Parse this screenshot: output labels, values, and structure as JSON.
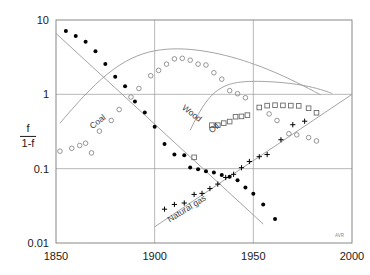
{
  "chart_data": {
    "type": "scatter",
    "title": "",
    "xlabel": "",
    "ylabel": "f / 1-f",
    "ylabel_numerator": "f",
    "ylabel_denominator": "1-f",
    "xlim": [
      1850,
      2000
    ],
    "ylim": [
      0.01,
      10
    ],
    "yscale": "log",
    "xticks": [
      1850,
      1900,
      1950,
      2000
    ],
    "xtick_labels": [
      "1850",
      "1900",
      "1950",
      "2000"
    ],
    "yticks": [
      0.01,
      0.1,
      1,
      10
    ],
    "ytick_labels": [
      "0.01",
      "0.1",
      "1",
      "10"
    ],
    "grid": true,
    "legend": "inline-annotations",
    "credit": "AVR",
    "series": [
      {
        "name": "Wood",
        "marker": "filled-circle",
        "color": "#000000",
        "label_x": 1918,
        "label_y": 0.52,
        "label_rotation": 38,
        "fit_line": {
          "x": [
            1850,
            1955
          ],
          "y": [
            6.6,
            0.018
          ]
        },
        "points": [
          {
            "x": 1855,
            "y": 7.1
          },
          {
            "x": 1860,
            "y": 6.1
          },
          {
            "x": 1865,
            "y": 5.1
          },
          {
            "x": 1870,
            "y": 3.8
          },
          {
            "x": 1875,
            "y": 2.55
          },
          {
            "x": 1880,
            "y": 1.72
          },
          {
            "x": 1885,
            "y": 1.28
          },
          {
            "x": 1890,
            "y": 0.8
          },
          {
            "x": 1895,
            "y": 0.57
          },
          {
            "x": 1900,
            "y": 0.365
          },
          {
            "x": 1905,
            "y": 0.215
          },
          {
            "x": 1910,
            "y": 0.155
          },
          {
            "x": 1915,
            "y": 0.152
          },
          {
            "x": 1918,
            "y": 0.104
          },
          {
            "x": 1922,
            "y": 0.098
          },
          {
            "x": 1926,
            "y": 0.092
          },
          {
            "x": 1930,
            "y": 0.089
          },
          {
            "x": 1934,
            "y": 0.082
          },
          {
            "x": 1938,
            "y": 0.078
          },
          {
            "x": 1942,
            "y": 0.07
          },
          {
            "x": 1946,
            "y": 0.056
          },
          {
            "x": 1950,
            "y": 0.046
          },
          {
            "x": 1955,
            "y": 0.033
          },
          {
            "x": 1961,
            "y": 0.021
          }
        ]
      },
      {
        "name": "Coal",
        "marker": "open-circle",
        "color": "#8a8a8a",
        "label_x": 1872,
        "label_y": 0.4,
        "label_rotation": -38,
        "fit_curve_peak": {
          "x": 1912,
          "y": 3.05
        },
        "points": [
          {
            "x": 1852,
            "y": 0.172
          },
          {
            "x": 1858,
            "y": 0.188
          },
          {
            "x": 1862,
            "y": 0.205
          },
          {
            "x": 1865,
            "y": 0.22
          },
          {
            "x": 1868,
            "y": 0.163
          },
          {
            "x": 1872,
            "y": 0.32
          },
          {
            "x": 1878,
            "y": 0.445
          },
          {
            "x": 1882,
            "y": 0.625
          },
          {
            "x": 1888,
            "y": 0.92
          },
          {
            "x": 1892,
            "y": 1.2
          },
          {
            "x": 1898,
            "y": 1.78
          },
          {
            "x": 1902,
            "y": 2.1
          },
          {
            "x": 1906,
            "y": 2.55
          },
          {
            "x": 1910,
            "y": 3.0
          },
          {
            "x": 1914,
            "y": 3.05
          },
          {
            "x": 1918,
            "y": 2.88
          },
          {
            "x": 1922,
            "y": 2.55
          },
          {
            "x": 1926,
            "y": 2.48
          },
          {
            "x": 1930,
            "y": 1.95
          },
          {
            "x": 1934,
            "y": 1.6
          },
          {
            "x": 1938,
            "y": 1.12
          },
          {
            "x": 1942,
            "y": 1.02
          },
          {
            "x": 1946,
            "y": 0.9
          },
          {
            "x": 1958,
            "y": 0.545
          },
          {
            "x": 1962,
            "y": 0.445
          },
          {
            "x": 1968,
            "y": 0.295
          },
          {
            "x": 1972,
            "y": 0.285
          },
          {
            "x": 1978,
            "y": 0.262
          },
          {
            "x": 1982,
            "y": 0.236
          }
        ]
      },
      {
        "name": "Oil",
        "marker": "open-square",
        "color": "#6a6a6a",
        "label_x": 1931,
        "label_y": 0.33,
        "label_rotation": -40,
        "points": [
          {
            "x": 1920,
            "y": 0.142
          },
          {
            "x": 1929,
            "y": 0.385
          },
          {
            "x": 1932,
            "y": 0.385
          },
          {
            "x": 1935,
            "y": 0.41
          },
          {
            "x": 1938,
            "y": 0.43
          },
          {
            "x": 1941,
            "y": 0.5
          },
          {
            "x": 1944,
            "y": 0.505
          },
          {
            "x": 1947,
            "y": 0.525
          },
          {
            "x": 1953,
            "y": 0.665
          },
          {
            "x": 1957,
            "y": 0.705
          },
          {
            "x": 1961,
            "y": 0.715
          },
          {
            "x": 1965,
            "y": 0.71
          },
          {
            "x": 1969,
            "y": 0.705
          },
          {
            "x": 1973,
            "y": 0.7
          },
          {
            "x": 1978,
            "y": 0.65
          },
          {
            "x": 1982,
            "y": 0.565
          }
        ]
      },
      {
        "name": "Natural gas",
        "marker": "plus",
        "color": "#000000",
        "label_x": 1917,
        "label_y": 0.027,
        "label_rotation": -32,
        "fit_line": {
          "x": [
            1900,
            2000
          ],
          "y": [
            0.0165,
            1.0
          ]
        },
        "points": [
          {
            "x": 1905,
            "y": 0.0285
          },
          {
            "x": 1910,
            "y": 0.033
          },
          {
            "x": 1915,
            "y": 0.0345
          },
          {
            "x": 1920,
            "y": 0.045
          },
          {
            "x": 1924,
            "y": 0.0465
          },
          {
            "x": 1928,
            "y": 0.054
          },
          {
            "x": 1932,
            "y": 0.062
          },
          {
            "x": 1936,
            "y": 0.076
          },
          {
            "x": 1940,
            "y": 0.084
          },
          {
            "x": 1944,
            "y": 0.103
          },
          {
            "x": 1948,
            "y": 0.125
          },
          {
            "x": 1953,
            "y": 0.145
          },
          {
            "x": 1957,
            "y": 0.155
          },
          {
            "x": 1964,
            "y": 0.245
          },
          {
            "x": 1970,
            "y": 0.39
          },
          {
            "x": 1976,
            "y": 0.435
          }
        ]
      }
    ]
  }
}
